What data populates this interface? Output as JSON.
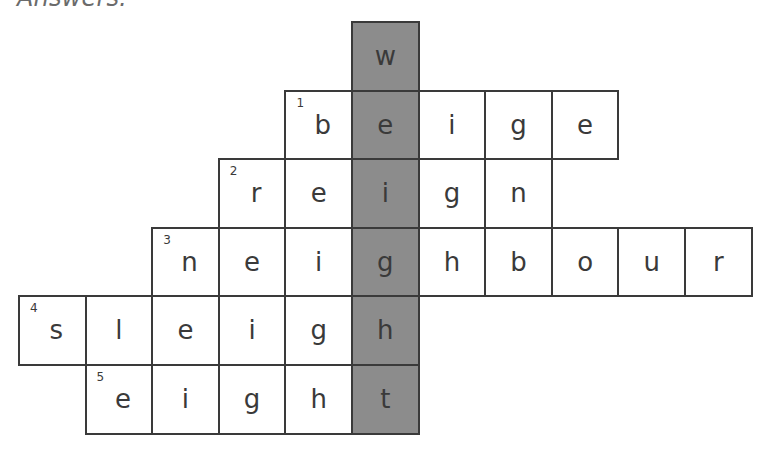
{
  "heading": "Answers:",
  "colors": {
    "border": "#3a3a3a",
    "shaded": "#8c8c8c",
    "cell": "#ffffff",
    "heading": "#6b6b6b"
  },
  "grid": {
    "origin_x": 19,
    "origin_y": 22,
    "cell_w": 66.6,
    "cell_h": 68.6,
    "shaded_column": 5,
    "hidden_word": "weight",
    "rows": [
      {
        "row": 0,
        "clue": null,
        "start_col": 5,
        "letters": [
          "w"
        ]
      },
      {
        "row": 1,
        "clue": 1,
        "start_col": 4,
        "letters": [
          "b",
          "e",
          "i",
          "g",
          "e"
        ],
        "word": "beige"
      },
      {
        "row": 2,
        "clue": 2,
        "start_col": 3,
        "letters": [
          "r",
          "e",
          "i",
          "g",
          "n"
        ],
        "word": "reign"
      },
      {
        "row": 3,
        "clue": 3,
        "start_col": 2,
        "letters": [
          "n",
          "e",
          "i",
          "g",
          "h",
          "b",
          "o",
          "u",
          "r"
        ],
        "word": "neighbour"
      },
      {
        "row": 4,
        "clue": 4,
        "start_col": 0,
        "letters": [
          "s",
          "l",
          "e",
          "i",
          "g",
          "h"
        ],
        "word": "sleigh"
      },
      {
        "row": 5,
        "clue": 5,
        "start_col": 1,
        "letters": [
          "e",
          "i",
          "g",
          "h",
          "t"
        ],
        "word": "eight"
      }
    ]
  }
}
